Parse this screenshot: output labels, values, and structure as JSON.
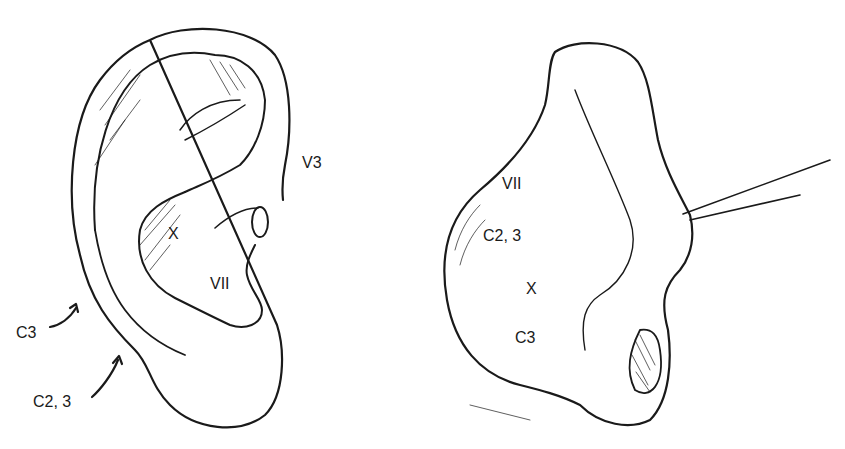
{
  "figure": {
    "left_panel": {
      "subject": "ear-lateral-view",
      "labels": {
        "v3": "V3",
        "x": "X",
        "vii": "VII",
        "c3": "C3",
        "c23": "C2, 3"
      }
    },
    "right_panel": {
      "subject": "ear-posterior-view-retracted",
      "labels": {
        "vii": "VII",
        "c23": "C2, 3",
        "x": "X",
        "c3": "C3"
      }
    },
    "colors": {
      "ink": "#1a1a1a",
      "background": "#ffffff"
    }
  }
}
